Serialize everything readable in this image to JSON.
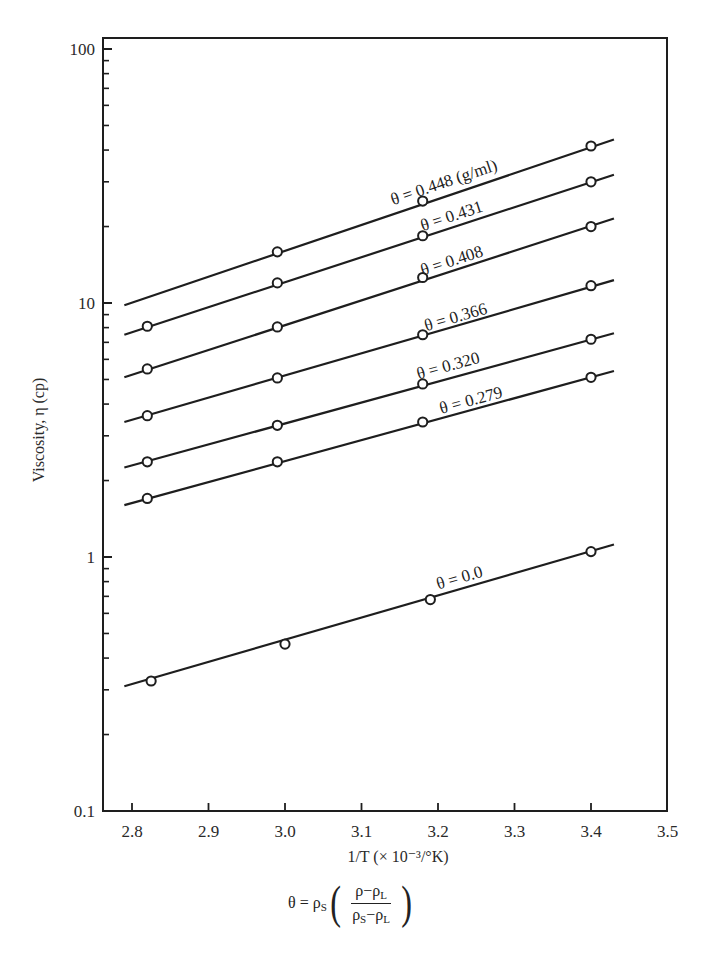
{
  "chart_data": {
    "type": "line",
    "title": "",
    "xlabel": "1/T (× 10⁻³/°K)",
    "ylabel": "Viscosity, η (cp)",
    "yscale": "log",
    "xlim": [
      2.77,
      3.5
    ],
    "ylim": [
      0.1,
      100
    ],
    "xticks": [
      2.8,
      2.9,
      3.0,
      3.1,
      3.2,
      3.3,
      3.4,
      3.5
    ],
    "xtick_labels": [
      "2.8",
      "2.9",
      "3.0",
      "3.1",
      "3.2",
      "3.3",
      "3.4",
      "3.5"
    ],
    "yticks": [
      0.1,
      1,
      10,
      100
    ],
    "ytick_labels": [
      "0.1",
      "1",
      "10",
      "100"
    ],
    "grid": false,
    "legend": "inline labels on lines",
    "line_x_range": [
      2.79,
      3.43
    ],
    "series": [
      {
        "name": "θ = 0.448 (g/ml)",
        "theta": 0.448,
        "x": [
          2.99,
          3.18,
          3.4
        ],
        "values": [
          15.9,
          25.2,
          41.5
        ],
        "fit": {
          "x": [
            2.79,
            3.43
          ],
          "y": [
            9.8,
            44.0
          ]
        }
      },
      {
        "name": "θ = 0.431",
        "theta": 0.431,
        "x": [
          2.82,
          2.99,
          3.18,
          3.4
        ],
        "values": [
          8.1,
          12.0,
          18.4,
          30.0
        ],
        "fit": {
          "x": [
            2.79,
            3.43
          ],
          "y": [
            7.5,
            32.0
          ]
        }
      },
      {
        "name": "θ = 0.408",
        "theta": 0.408,
        "x": [
          2.82,
          2.99,
          3.18,
          3.4
        ],
        "values": [
          5.5,
          8.05,
          12.6,
          20.0
        ],
        "fit": {
          "x": [
            2.79,
            3.43
          ],
          "y": [
            5.1,
            21.5
          ]
        }
      },
      {
        "name": "θ = 0.366",
        "theta": 0.366,
        "x": [
          2.82,
          2.99,
          3.18,
          3.4
        ],
        "values": [
          3.6,
          5.07,
          7.5,
          11.7
        ],
        "fit": {
          "x": [
            2.79,
            3.43
          ],
          "y": [
            3.4,
            12.3
          ]
        }
      },
      {
        "name": "θ = 0.320",
        "theta": 0.32,
        "x": [
          2.82,
          2.99,
          3.18,
          3.4
        ],
        "values": [
          2.37,
          3.3,
          4.8,
          7.2
        ],
        "fit": {
          "x": [
            2.79,
            3.43
          ],
          "y": [
            2.25,
            7.6
          ]
        }
      },
      {
        "name": "θ = 0.279",
        "theta": 0.279,
        "x": [
          2.82,
          2.99,
          3.18,
          3.4
        ],
        "values": [
          1.7,
          2.37,
          3.4,
          5.1
        ],
        "fit": {
          "x": [
            2.79,
            3.43
          ],
          "y": [
            1.6,
            5.4
          ]
        }
      },
      {
        "name": "θ = 0.0",
        "theta": 0.0,
        "x": [
          2.825,
          3.0,
          3.19,
          3.4
        ],
        "values": [
          0.325,
          0.454,
          0.68,
          1.05
        ],
        "fit": {
          "x": [
            2.79,
            3.43
          ],
          "y": [
            0.31,
            1.12
          ]
        }
      }
    ],
    "label_positions": [
      {
        "series": 0,
        "x": 3.21,
        "anchor_value": 28.5
      },
      {
        "series": 1,
        "x": 3.22,
        "anchor_value": 21.0
      },
      {
        "series": 2,
        "x": 3.22,
        "anchor_value": 14.0
      },
      {
        "series": 3,
        "x": 3.225,
        "anchor_value": 8.4
      },
      {
        "series": 4,
        "x": 3.215,
        "anchor_value": 5.4
      },
      {
        "series": 5,
        "x": 3.245,
        "anchor_value": 3.95
      },
      {
        "series": 6,
        "x": 3.23,
        "anchor_value": 0.79
      }
    ]
  },
  "formula": {
    "lhs": "θ = ρ",
    "lhs_sub": "S",
    "num_a": "ρ−ρ",
    "num_sub": "L",
    "den_a": "ρ",
    "den_sub1": "S",
    "den_mid": "−ρ",
    "den_sub2": "L",
    "open_paren": "(",
    "close_paren": ")"
  },
  "style": {
    "line_color": "#1e1e1e",
    "marker_fill": "#ffffff",
    "background": "#ffffff"
  }
}
